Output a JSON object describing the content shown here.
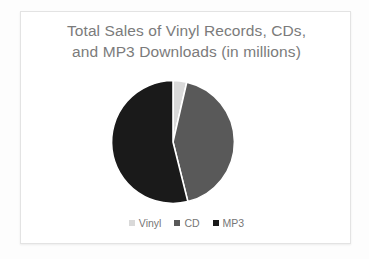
{
  "chart_data": {
    "type": "pie",
    "title": "Total Sales of Vinyl Records, CDs,\nand MP3 Downloads (in millions)",
    "title_line_1": "Total Sales of Vinyl Records, CDs,",
    "title_line_2": "and MP3 Downloads (in millions)",
    "categories": [
      "Vinyl",
      "CD",
      "MP3"
    ],
    "values": [
      3.6,
      42.5,
      53.9
    ],
    "units": "millions",
    "percentages": [
      3.6,
      42.5,
      53.9
    ],
    "angles_deg": [
      13,
      153,
      194
    ],
    "start_angle_deg": 0,
    "direction": "clockwise",
    "colors": [
      "#d9d9d9",
      "#595959",
      "#1a1a1a"
    ],
    "legend_position": "bottom",
    "grid": false,
    "xlabel": "",
    "ylabel": "",
    "data_labels_shown": false,
    "slices": [
      {
        "label": "Vinyl",
        "value": 3.6,
        "color": "#d9d9d9",
        "start_deg": 0,
        "end_deg": 13
      },
      {
        "label": "CD",
        "value": 42.5,
        "color": "#595959",
        "start_deg": 13,
        "end_deg": 166
      },
      {
        "label": "MP3",
        "value": 53.9,
        "color": "#1a1a1a",
        "start_deg": 166,
        "end_deg": 360
      }
    ]
  },
  "legend": {
    "items": [
      {
        "label": "Vinyl",
        "color": "#d9d9d9"
      },
      {
        "label": "CD",
        "color": "#595959"
      },
      {
        "label": "MP3",
        "color": "#1a1a1a"
      }
    ]
  },
  "style": {
    "title_color": "#7b7b7b",
    "legend_text_color": "#767676",
    "plate_background": "#ffffff",
    "plate_border": "#e3e3e3",
    "page_background": "#fdfdfd",
    "slice_separator": "#ffffff"
  }
}
